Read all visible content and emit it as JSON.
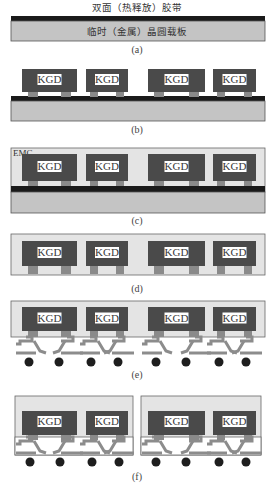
{
  "title": "双面（热释放）胶带",
  "colors": {
    "die": "#4a4a4a",
    "kgd_box": "#ffffff",
    "pad": "#8a8a8a",
    "tape": "#1a1a1a",
    "carrier": "#c4c4c4",
    "emc": "#e4e4e4",
    "outline": "#555555",
    "rdl": "#8c8c8c",
    "ball": "#1e1e1e"
  },
  "steps": [
    {
      "id": "a",
      "caption": "(a)",
      "carrier_label": "临时（金属）晶圆载板"
    },
    {
      "id": "b",
      "caption": "(b)"
    },
    {
      "id": "c",
      "caption": "(c)",
      "emc_label": "EMC"
    },
    {
      "id": "d",
      "caption": "(d)"
    },
    {
      "id": "e",
      "caption": "(e)"
    },
    {
      "id": "f",
      "caption": "(f)"
    }
  ],
  "die_label": "KGD"
}
